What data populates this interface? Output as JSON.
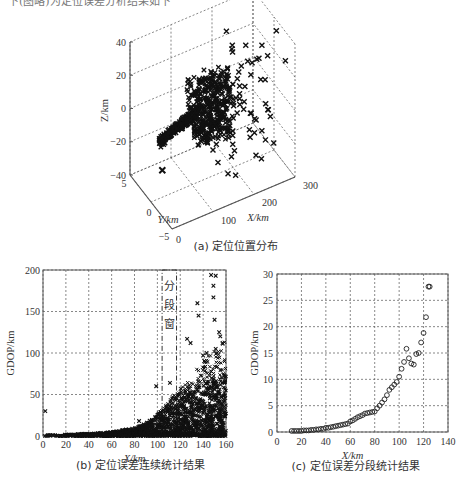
{
  "page": {
    "top_text_fragment": "下(图略)为定位误差分析结果如下"
  },
  "chart_data": [
    {
      "id": "a",
      "type": "scatter3d",
      "caption": "(a) 定位位置分布",
      "xlabel": "X/km",
      "ylabel": "Y/km",
      "zlabel": "Z/km",
      "xlim": [
        0,
        300
      ],
      "ylim": [
        -5,
        5
      ],
      "zlim": [
        -40,
        40
      ],
      "xticks": [
        "0",
        "100",
        "200",
        "300"
      ],
      "yticks": [
        "5",
        "0",
        "-5"
      ],
      "zticks": [
        "40",
        "20",
        "0",
        "-20",
        "-40"
      ],
      "marker": "x",
      "description": "Dense cluster of positions along a narrow ribbon near Y≈0, Z≈0 from X≈0 to ~150 km, spreading to Z ±30 km and X up to ~300 km at longer range; a lone outlier near X≈0, Y≈5, Z≈-40."
    },
    {
      "id": "b",
      "type": "scatter",
      "caption": "(b) 定位误差连续统计结果",
      "xlabel": "X/km",
      "ylabel": "GDOP/km",
      "xlim": [
        0,
        160
      ],
      "ylim": [
        0,
        200
      ],
      "xticks": [
        "0",
        "20",
        "40",
        "60",
        "80",
        "100",
        "120",
        "140",
        "160"
      ],
      "yticks": [
        "0",
        "50",
        "100",
        "150",
        "200"
      ],
      "marker": "x",
      "annotation": {
        "text": "分段窗",
        "x_range": [
          105,
          115
        ]
      },
      "envelope": {
        "x": [
          0,
          20,
          40,
          60,
          80,
          90,
          100,
          110,
          120,
          130,
          140,
          150,
          160
        ],
        "y_upper_dense": [
          1,
          2,
          3,
          5,
          10,
          16,
          25,
          35,
          45,
          55,
          65,
          70,
          75
        ]
      },
      "outliers": [
        {
          "x": 2,
          "y": 30
        },
        {
          "x": 84,
          "y": 18
        },
        {
          "x": 99,
          "y": 60
        },
        {
          "x": 111,
          "y": 64
        },
        {
          "x": 126,
          "y": 117
        },
        {
          "x": 129,
          "y": 112
        },
        {
          "x": 135,
          "y": 160
        },
        {
          "x": 136,
          "y": 145
        },
        {
          "x": 147,
          "y": 194
        },
        {
          "x": 151,
          "y": 193
        },
        {
          "x": 149,
          "y": 181
        },
        {
          "x": 149,
          "y": 167
        },
        {
          "x": 150,
          "y": 140
        },
        {
          "x": 154,
          "y": 125
        },
        {
          "x": 155,
          "y": 120
        },
        {
          "x": 140,
          "y": 97
        },
        {
          "x": 143,
          "y": 100
        },
        {
          "x": 151,
          "y": 105
        },
        {
          "x": 157,
          "y": 112
        }
      ]
    },
    {
      "id": "c",
      "type": "scatter",
      "caption": "(c) 定位误差分段统计结果",
      "xlabel": "X/km",
      "ylabel": "GDOP/km",
      "xlim": [
        0,
        140
      ],
      "ylim": [
        0,
        30
      ],
      "xticks": [
        "0",
        "20",
        "40",
        "60",
        "80",
        "100",
        "120",
        "140"
      ],
      "yticks": [
        "0",
        "5",
        "10",
        "15",
        "20",
        "25",
        "30"
      ],
      "marker": "o",
      "x": [
        12,
        14,
        16,
        18,
        20,
        22,
        24,
        26,
        28,
        30,
        32,
        34,
        36,
        38,
        40,
        42,
        44,
        46,
        48,
        50,
        52,
        54,
        56,
        58,
        60,
        62,
        64,
        66,
        68,
        70,
        72,
        74,
        76,
        78,
        80,
        82,
        84,
        86,
        88,
        90,
        92,
        94,
        96,
        98,
        100,
        102,
        104,
        106,
        108,
        110,
        112,
        114,
        116,
        118,
        120,
        122,
        124
      ],
      "y": [
        0.2,
        0.2,
        0.2,
        0.2,
        0.2,
        0.3,
        0.3,
        0.3,
        0.4,
        0.4,
        0.5,
        0.5,
        0.6,
        0.6,
        0.8,
        0.8,
        0.9,
        1.0,
        1.1,
        1.2,
        1.3,
        1.4,
        1.5,
        1.6,
        2.0,
        2.2,
        2.5,
        2.8,
        3.0,
        3.2,
        3.5,
        3.6,
        3.7,
        3.8,
        3.9,
        4.5,
        5.0,
        5.6,
        6.2,
        7.0,
        8.0,
        8.5,
        9.0,
        9.5,
        10.5,
        12.0,
        13.3,
        15.8,
        14.0,
        13.0,
        12.8,
        14.8,
        15.0,
        17.0,
        18.8,
        21.8,
        27.6
      ]
    }
  ]
}
